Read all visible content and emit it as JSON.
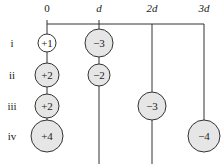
{
  "diagram": {
    "columns": [
      {
        "label": "0",
        "x": 47
      },
      {
        "label": "d",
        "x": 99
      },
      {
        "label": "2d",
        "x": 152
      },
      {
        "label": "3d",
        "x": 204
      }
    ],
    "rows": [
      {
        "label": "i",
        "y": 43
      },
      {
        "label": "ii",
        "y": 75
      },
      {
        "label": "iii",
        "y": 106
      },
      {
        "label": "iv",
        "y": 136
      }
    ],
    "charges": [
      {
        "row": "i",
        "position": "0",
        "value": "+1",
        "cx": 47,
        "cy": 43,
        "r": 9,
        "fill": "#ffffff"
      },
      {
        "row": "i",
        "position": "d",
        "value": "−3",
        "cx": 99,
        "cy": 43,
        "r": 14,
        "fill": "#e6e6e6"
      },
      {
        "row": "ii",
        "position": "0",
        "value": "+2",
        "cx": 47,
        "cy": 75,
        "r": 12,
        "fill": "#e6e6e6"
      },
      {
        "row": "ii",
        "position": "d",
        "value": "−2",
        "cx": 99,
        "cy": 75,
        "r": 11,
        "fill": "#e6e6e6"
      },
      {
        "row": "iii",
        "position": "0",
        "value": "+2",
        "cx": 47,
        "cy": 106,
        "r": 12,
        "fill": "#e6e6e6"
      },
      {
        "row": "iii",
        "position": "2d",
        "value": "−3",
        "cx": 152,
        "cy": 106,
        "r": 14,
        "fill": "#e6e6e6"
      },
      {
        "row": "iv",
        "position": "0",
        "value": "+4",
        "cx": 47,
        "cy": 136,
        "r": 16,
        "fill": "#e6e6e6"
      },
      {
        "row": "iv",
        "position": "3d",
        "value": "−4",
        "cx": 204,
        "cy": 136,
        "r": 16,
        "fill": "#e6e6e6"
      }
    ],
    "colors": {
      "line": "#333333",
      "circle_fill": "#e6e6e6",
      "text": "#222222"
    }
  }
}
